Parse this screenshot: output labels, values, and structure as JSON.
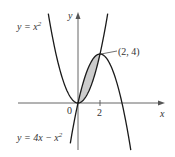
{
  "chart_data": {
    "type": "line",
    "title": "",
    "xlabel": "x",
    "ylabel": "y",
    "xlim": [
      -5.5,
      7.8
    ],
    "ylim": [
      -3.6,
      7.5
    ],
    "grid": false,
    "legend": "none",
    "x_ticks": [
      {
        "value": 2,
        "label": "2"
      }
    ],
    "origin_label": "0",
    "series": [
      {
        "name": "y = x^2",
        "label": "y = x",
        "label_sup": "2",
        "equation": "x^2",
        "x": [
          -2.7,
          -2,
          -1,
          0,
          1,
          2,
          2.7
        ],
        "values": [
          7.29,
          4,
          1,
          0,
          1,
          4,
          7.29
        ]
      },
      {
        "name": "y = 4x - x^2",
        "label": "y = 4x − x",
        "label_sup": "2",
        "equation": "4x - x^2",
        "x": [
          -0.7,
          0,
          1,
          2,
          3,
          4,
          4.8
        ],
        "values": [
          -3.29,
          0,
          3,
          4,
          3,
          0,
          -3.84
        ]
      }
    ],
    "shaded_region": {
      "between": [
        "4x - x^2",
        "x^2"
      ],
      "x_from": 0,
      "x_to": 2,
      "color": "#cccccc"
    },
    "annotations": [
      {
        "text": "(2, 4)",
        "x": 2,
        "y": 4
      }
    ],
    "colors": {
      "curve": "#1a1a1a",
      "axis": "#555555",
      "fill": "#cccccc",
      "text": "#333333"
    }
  }
}
